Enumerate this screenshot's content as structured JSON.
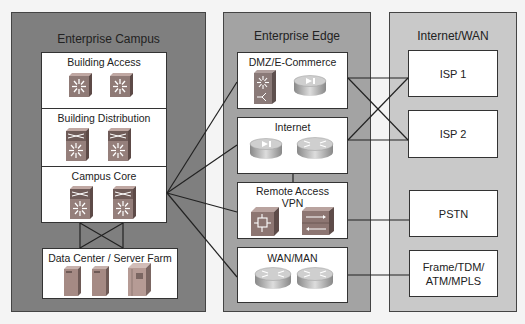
{
  "colors": {
    "campus_panel": "#7f7f7f",
    "edge_panel": "#a3a3a3",
    "wan_panel": "#c9c9c9",
    "box_fill": "#ffffff",
    "line": "#222222",
    "switch_icon": "#9a7f7a",
    "router_icon": "#b8b8b8"
  },
  "panels": {
    "campus": {
      "title": "Enterprise Campus",
      "modules": {
        "access": {
          "title": "Building Access",
          "icons": [
            "multilayer-switch",
            "multilayer-switch"
          ]
        },
        "distribution": {
          "title": "Building Distribution",
          "icons": [
            "layer3-switch",
            "layer3-switch"
          ]
        },
        "core": {
          "title": "Campus Core",
          "icons": [
            "layer3-switch",
            "layer3-switch"
          ]
        },
        "datacenter": {
          "title": "Data Center / Server Farm",
          "icons": [
            "server",
            "server",
            "mainframe-server"
          ]
        }
      }
    },
    "edge": {
      "title": "Enterprise Edge",
      "modules": {
        "dmz": {
          "title": "DMZ/E-Commerce",
          "icons": [
            "content-switch",
            "firewall-router"
          ]
        },
        "internet": {
          "title": "Internet",
          "icons": [
            "firewall-router",
            "router"
          ]
        },
        "vpn": {
          "title": "Remote Access\nVPN",
          "title_line1": "Remote Access",
          "title_line2": "VPN",
          "icons": [
            "vpn-concentrator",
            "pix-firewall"
          ]
        },
        "wan": {
          "title": "WAN/MAN",
          "icons": [
            "router",
            "router"
          ]
        }
      }
    },
    "wan": {
      "title": "Internet/WAN",
      "modules": {
        "isp1": {
          "label": "ISP 1"
        },
        "isp2": {
          "label": "ISP 2"
        },
        "pstn": {
          "label": "PSTN"
        },
        "frame": {
          "label": "Frame/TDM/\nATM/MPLS"
        }
      }
    }
  },
  "connections": [
    {
      "from": "campus.core",
      "to": "edge.dmz"
    },
    {
      "from": "campus.core",
      "to": "edge.internet"
    },
    {
      "from": "campus.core",
      "to": "edge.vpn"
    },
    {
      "from": "campus.core",
      "to": "edge.wan"
    },
    {
      "from": "campus.core",
      "to": "campus.datacenter",
      "type": "redundant-cross"
    },
    {
      "from": "edge.dmz",
      "to": "wan.isp1"
    },
    {
      "from": "edge.dmz",
      "to": "wan.isp2"
    },
    {
      "from": "edge.internet",
      "to": "wan.isp1"
    },
    {
      "from": "edge.internet",
      "to": "wan.isp2"
    },
    {
      "from": "edge.internet",
      "to": "edge.vpn"
    },
    {
      "from": "edge.vpn",
      "to": "wan.pstn"
    },
    {
      "from": "edge.wan",
      "to": "wan.frame"
    }
  ]
}
